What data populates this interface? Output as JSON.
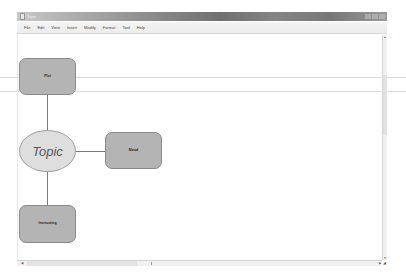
{
  "window": {
    "title": "Topic",
    "controls": [
      "minimize",
      "maximize",
      "close"
    ]
  },
  "menubar": {
    "items": [
      {
        "label": "File"
      },
      {
        "label": "Edit"
      },
      {
        "label": "View"
      },
      {
        "label": "Insert"
      },
      {
        "label": "Modify"
      },
      {
        "label": "Format"
      },
      {
        "label": "Tool"
      },
      {
        "label": "Help"
      }
    ]
  },
  "diagram": {
    "central": {
      "label": "Topic",
      "shape": "ellipse",
      "fill": "#dedede"
    },
    "nodes": [
      {
        "label": "Plot",
        "shape": "rounded-rect",
        "position": "top",
        "fill": "#b4b4b4"
      },
      {
        "label": "Mood",
        "shape": "rounded-rect",
        "position": "right",
        "fill": "#b4b4b4"
      },
      {
        "label": "Instructing",
        "shape": "rounded-rect",
        "position": "bottom",
        "fill": "#b4b4b4"
      }
    ],
    "connector_color": "#7a7a7a"
  },
  "scrollbars": {
    "vertical": {
      "up_icon": "▲",
      "down_icon": "▼"
    },
    "horizontal": {
      "left_icon": "◀",
      "right_icon": "▶"
    },
    "grip_icon": "◢"
  }
}
